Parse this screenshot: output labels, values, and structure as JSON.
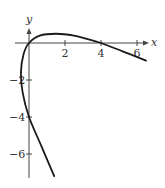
{
  "chart_data": {
    "type": "line",
    "subtype": "parametric-curve",
    "title": "",
    "xlabel": "x",
    "ylabel": "y",
    "xlim": [
      -1.0,
      6.8
    ],
    "ylim": [
      -7.3,
      1.2
    ],
    "grid": false,
    "legend": null,
    "x_ticks": [
      {
        "value": 2,
        "label": "2"
      },
      {
        "value": 4,
        "label": "4"
      },
      {
        "value": 6,
        "label": "6"
      }
    ],
    "y_ticks": [
      {
        "value": -2,
        "label": "−2"
      },
      {
        "value": -4,
        "label": "−4"
      },
      {
        "value": -6,
        "label": "−6"
      }
    ],
    "series": [
      {
        "name": "curve",
        "color": "#1a1a1a",
        "points": [
          {
            "x": 1.4,
            "y": -7.2
          },
          {
            "x": 0.7,
            "y": -5.6
          },
          {
            "x": 0.0,
            "y": -4.0
          },
          {
            "x": -0.35,
            "y": -2.7
          },
          {
            "x": -0.45,
            "y": -1.6
          },
          {
            "x": -0.3,
            "y": -0.6
          },
          {
            "x": 0.0,
            "y": 0.0
          },
          {
            "x": 0.6,
            "y": 0.4
          },
          {
            "x": 1.5,
            "y": 0.5
          },
          {
            "x": 2.5,
            "y": 0.4
          },
          {
            "x": 3.3,
            "y": 0.2
          },
          {
            "x": 4.0,
            "y": 0.0
          },
          {
            "x": 5.2,
            "y": -0.45
          },
          {
            "x": 6.5,
            "y": -0.95
          }
        ]
      }
    ]
  },
  "labels": {
    "x_axis": "x",
    "y_axis": "y",
    "x_tick_2": "2",
    "x_tick_4": "4",
    "x_tick_6": "6",
    "y_tick_m2": "−2",
    "y_tick_m4": "−4",
    "y_tick_m6": "−6"
  }
}
